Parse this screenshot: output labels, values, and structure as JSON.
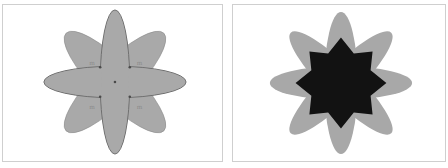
{
  "figure": {
    "panels": [
      {
        "id": "left",
        "description": "Eight-petal flower made of overlapping ellipses with anchor points",
        "fill": "#a9a9a9",
        "stroke": "#7a7a7a",
        "labels": [
          "m",
          "m",
          "m",
          "m"
        ]
      },
      {
        "id": "right",
        "description": "Eight-petal flower with overlapping region shown as dark eight-point star",
        "fill": "#a8a8a8",
        "overlap_fill": "#121212"
      }
    ]
  }
}
